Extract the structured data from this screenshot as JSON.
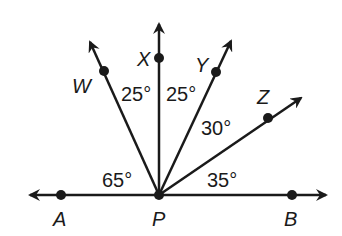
{
  "diagram": {
    "vertex": "P",
    "line": {
      "points": [
        "A",
        "P",
        "B"
      ]
    },
    "rays": [
      "PW",
      "PX",
      "PY",
      "PZ"
    ],
    "points": {
      "A": {
        "label": "A"
      },
      "P": {
        "label": "P"
      },
      "B": {
        "label": "B"
      },
      "W": {
        "label": "W"
      },
      "X": {
        "label": "X"
      },
      "Y": {
        "label": "Y"
      },
      "Z": {
        "label": "Z"
      }
    },
    "angles": {
      "APW": "65°",
      "WPX": "25°",
      "XPY": "25°",
      "YPZ": "30°",
      "ZPB": "35°"
    },
    "colors": {
      "stroke": "#1a1a1a",
      "background": "#ffffff"
    }
  }
}
